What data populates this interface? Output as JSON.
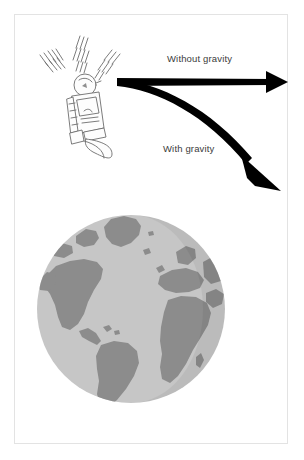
{
  "figure": {
    "width": 304,
    "height": 460,
    "background_color": "#ffffff",
    "border_color": "#e3e3e3"
  },
  "labels": {
    "without_gravity": "Without gravity",
    "with_gravity": "With gravity"
  },
  "arrows": {
    "straight": {
      "name": "without-gravity-arrow",
      "description": "straight horizontal arrow",
      "color": "#000000",
      "start": [
        117,
        82
      ],
      "end": [
        285,
        82
      ]
    },
    "curved": {
      "name": "with-gravity-arrow",
      "description": "curved arrow bending downward",
      "color": "#000000",
      "start": [
        117,
        84
      ],
      "end": [
        280,
        190
      ]
    }
  },
  "satellite": {
    "name": "satellite",
    "line_color": "#6d6d6d",
    "fill_color": "#fdfdfd",
    "center": [
      84,
      100
    ],
    "signal_groups": 3
  },
  "earth": {
    "name": "earth-globe",
    "center": [
      131,
      309
    ],
    "radius": 94,
    "ocean_color": "#c6c6c6",
    "land_color": "#8c8c8c",
    "landmasses": [
      "North America",
      "South America",
      "Greenland",
      "Africa",
      "Europe",
      "Western Asia"
    ]
  }
}
